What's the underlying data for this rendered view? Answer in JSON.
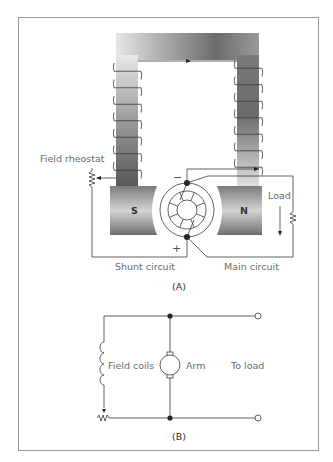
{
  "figure": {
    "panel_a": {
      "caption": "(A)",
      "labels": {
        "field_rheostat": "Field rheostat",
        "load": "Load",
        "shunt_circuit": "Shunt circuit",
        "main_circuit": "Main circuit",
        "south_pole": "S",
        "north_pole": "N",
        "negative": "−",
        "positive": "+"
      }
    },
    "panel_b": {
      "caption": "(B)",
      "labels": {
        "field_coils": "Field coils",
        "armature": "Arm",
        "to_load": "To load"
      }
    }
  },
  "colors": {
    "line": "#3a3a3a",
    "label": "#6b6b6b",
    "frame": "#9a9a9a"
  }
}
